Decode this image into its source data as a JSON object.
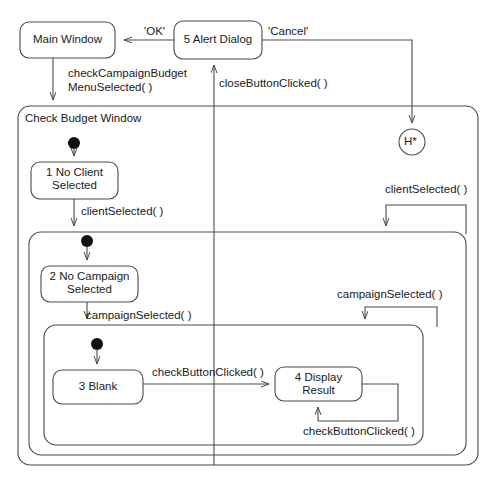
{
  "diagram": {
    "type": "uml-statechart",
    "stroke_color": "#4a4a4a",
    "text_color": "#1a1a1a",
    "background": "#ffffff"
  },
  "states": {
    "main_window": {
      "label": "Main Window",
      "x": 20,
      "y": 22,
      "w": 95,
      "h": 36
    },
    "alert_dialog": {
      "label": "5 Alert Dialog",
      "x": 174,
      "y": 21,
      "w": 88,
      "h": 38
    },
    "no_client": {
      "line1": "1 No Client",
      "line2": "Selected",
      "x": 31,
      "y": 162,
      "w": 87,
      "h": 37
    },
    "no_campaign": {
      "line1": "2 No Campaign",
      "line2": "Selected",
      "x": 41,
      "y": 266,
      "w": 97,
      "h": 36
    },
    "blank": {
      "label": "3 Blank",
      "x": 53,
      "y": 370,
      "w": 90,
      "h": 34
    },
    "display_result": {
      "line1": "4 Display",
      "line2": "Result",
      "x": 275,
      "y": 367,
      "w": 87,
      "h": 34
    }
  },
  "containers": {
    "check_budget_window": {
      "label": "Check Budget Window",
      "x": 18,
      "y": 106,
      "w": 460,
      "h": 359
    },
    "client_region": {
      "label": "",
      "x": 29,
      "y": 232,
      "w": 437,
      "h": 223
    },
    "campaign_region": {
      "label": "",
      "x": 44,
      "y": 325,
      "w": 379,
      "h": 120
    }
  },
  "history": {
    "label": "H*",
    "cx": 412,
    "cy": 142,
    "r": 13
  },
  "initial_nodes": [
    {
      "name": "initial-check-budget",
      "cx": 74,
      "cy": 143,
      "r": 6
    },
    {
      "name": "initial-client-region",
      "cx": 87,
      "cy": 241,
      "r": 6
    },
    {
      "name": "initial-campaign-region",
      "cx": 97,
      "cy": 344,
      "r": 6
    }
  ],
  "transitions": [
    {
      "name": "alert-to-main-ok",
      "label": "'OK'",
      "label_x": 144,
      "label_y": 25
    },
    {
      "name": "alert-cancel-to-history",
      "label": "'Cancel'",
      "label_x": 268,
      "label_y": 25
    },
    {
      "name": "main-to-check-budget",
      "label_line1": "checkCampaignBudget",
      "label_line2": "MenuSelected( )",
      "label_x": 68,
      "label_y": 67
    },
    {
      "name": "check-budget-to-alert",
      "label": "closeButtonClicked( )",
      "label_x": 219,
      "label_y": 77
    },
    {
      "name": "no-client-to-client-region",
      "label": "clientSelected( )",
      "label_x": 81,
      "label_y": 205
    },
    {
      "name": "client-region-self-loop",
      "label": "clientSelected( )",
      "label_x": 385,
      "label_y": 183
    },
    {
      "name": "no-campaign-to-campaign-region",
      "label": "campaignSelected( )",
      "label_x": 86,
      "label_y": 309
    },
    {
      "name": "campaign-region-self-loop",
      "label": "campaignSelected( )",
      "label_x": 337,
      "label_y": 288
    },
    {
      "name": "blank-to-display-result",
      "label": "checkButtonClicked( )",
      "label_x": 152,
      "label_y": 366
    },
    {
      "name": "display-result-self-loop",
      "label": "checkButtonClicked( )",
      "label_x": 303,
      "label_y": 425
    }
  ]
}
